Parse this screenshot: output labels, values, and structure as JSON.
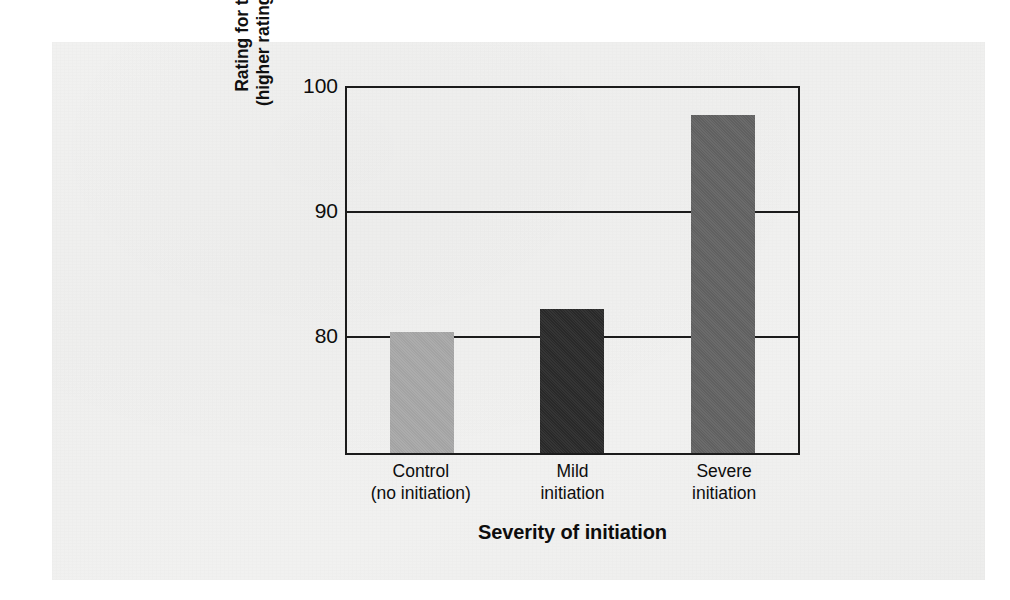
{
  "chart_data": {
    "type": "bar",
    "title": "",
    "categories": [
      "Control\n(no initiation)",
      "Mild\ninitiation",
      "Severe\ninitiation"
    ],
    "category_lines": [
      [
        "Control",
        "(no initiation)"
      ],
      [
        "Mild",
        "initiation"
      ],
      [
        "Severe",
        "initiation"
      ]
    ],
    "values": [
      80.3,
      82.1,
      97.8
    ],
    "bar_colors": [
      "#a8a8a8",
      "#2a2a2a",
      "#636363"
    ],
    "xlabel": "Severity of initiation",
    "ylabel": "Rating for the discussion group (higher rating means greater liking)",
    "ylabel_lines": [
      "Rating for the discussion group",
      "(higher rating means greater liking)"
    ],
    "yticks": [
      80,
      90,
      100
    ],
    "ytick_labels": [
      "80",
      "90",
      "100"
    ],
    "ylim": [
      70.5,
      100
    ],
    "grid": true,
    "legend": "none"
  },
  "axis": {
    "y_title_line1": "Rating for the discussion group",
    "y_title_line2": "(higher rating means greater liking)",
    "x_title": "Severity of initiation"
  },
  "ticks": {
    "y": [
      {
        "label": "100",
        "value": 100
      },
      {
        "label": "90",
        "value": 90
      },
      {
        "label": "80",
        "value": 80
      }
    ],
    "x": [
      {
        "line1": "Control",
        "line2": "(no initiation)"
      },
      {
        "line1": "Mild",
        "line2": "initiation"
      },
      {
        "line1": "Severe",
        "line2": "initiation"
      }
    ]
  },
  "bars": [
    {
      "name": "control",
      "value": 80.3,
      "color": "#a8a8a8"
    },
    {
      "name": "mild",
      "value": 82.1,
      "color": "#2a2a2a"
    },
    {
      "name": "severe",
      "value": 97.8,
      "color": "#636363"
    }
  ],
  "colors": {
    "page_background": "#ffffff",
    "scan_background": "#f0f0ef",
    "axis_line": "#1b1b1b",
    "text": "#0d0d0d"
  }
}
